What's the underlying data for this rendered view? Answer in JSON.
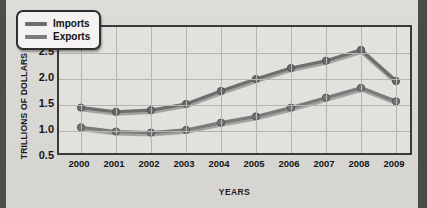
{
  "chart_data": {
    "type": "line",
    "title": "",
    "xlabel": "YEARS",
    "ylabel": "TRILLIONS OF DOLLARS",
    "categories": [
      "2000",
      "2001",
      "2002",
      "2003",
      "2004",
      "2005",
      "2006",
      "2007",
      "2008",
      "2009"
    ],
    "ylim": [
      0.5,
      3.0
    ],
    "yticks": [
      0.5,
      1.0,
      1.5,
      2.0,
      2.5,
      3.0
    ],
    "ytick_labels": [
      "0.5",
      "1.0",
      "1.5",
      "2.0",
      "2.5",
      "3.0"
    ],
    "grid": true,
    "legend_position": "top-left",
    "series": [
      {
        "name": "Imports",
        "color": "#6e6e6e",
        "values": [
          1.45,
          1.37,
          1.4,
          1.52,
          1.77,
          2.0,
          2.21,
          2.35,
          2.56,
          1.96
        ]
      },
      {
        "name": "Exports",
        "color": "#7b7b7b",
        "values": [
          1.07,
          0.99,
          0.97,
          1.02,
          1.16,
          1.28,
          1.45,
          1.64,
          1.83,
          1.57
        ]
      }
    ]
  },
  "legend": {
    "items": [
      {
        "label": "Imports"
      },
      {
        "label": "Exports"
      }
    ]
  },
  "axis": {
    "y_title": "TRILLIONS OF DOLLARS",
    "x_title": "YEARS"
  },
  "colors": {
    "background": "#d9d9d6",
    "plot_background": "#e3e1dd",
    "frame": "#3a3a3a",
    "grid": "#b6b4b0",
    "imports_line": "#6e6e6e",
    "exports_line": "#7b7b7b",
    "text": "#141414"
  }
}
